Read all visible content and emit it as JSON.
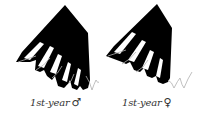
{
  "figure": {
    "type": "feather-pattern-illustration",
    "colors": {
      "wing_fill": "#000000",
      "outline": "#b0b0b0",
      "background": "#ffffff",
      "label_text": "#333333"
    },
    "panels": [
      {
        "id": "male",
        "label": "1st-year",
        "symbol": "♂",
        "symbol_name": "male-symbol"
      },
      {
        "id": "female",
        "label": "1st-year",
        "symbol": "♀",
        "symbol_name": "female-symbol"
      }
    ]
  }
}
